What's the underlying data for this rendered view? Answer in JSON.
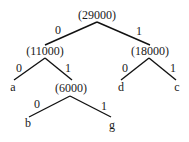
{
  "diagram": {
    "type": "huffman-tree",
    "nodes": [
      {
        "id": "root",
        "label": "(29000)",
        "x": 97,
        "y": 19
      },
      {
        "id": "n11000",
        "label": "(11000)",
        "x": 45,
        "y": 55
      },
      {
        "id": "n18000",
        "label": "(18000)",
        "x": 150,
        "y": 55
      },
      {
        "id": "leaf_a",
        "label": "a",
        "x": 13,
        "y": 91
      },
      {
        "id": "n6000",
        "label": "(6000)",
        "x": 71,
        "y": 92
      },
      {
        "id": "leaf_d",
        "label": "d",
        "x": 121,
        "y": 91
      },
      {
        "id": "leaf_c",
        "label": "c",
        "x": 177,
        "y": 91
      },
      {
        "id": "leaf_b",
        "label": "b",
        "x": 28,
        "y": 127
      },
      {
        "id": "leaf_g",
        "label": "g",
        "x": 112,
        "y": 129
      }
    ],
    "edges": [
      {
        "from": "root",
        "to": "n11000",
        "bit": "0",
        "x1": 97,
        "y1": 22,
        "x2": 45,
        "y2": 45,
        "lx": 58,
        "ly": 34
      },
      {
        "from": "root",
        "to": "n18000",
        "bit": "1",
        "x1": 97,
        "y1": 22,
        "x2": 150,
        "y2": 45,
        "lx": 139,
        "ly": 35
      },
      {
        "from": "n11000",
        "to": "leaf_a",
        "bit": "0",
        "x1": 45,
        "y1": 58,
        "x2": 14,
        "y2": 80,
        "lx": 19,
        "ly": 72
      },
      {
        "from": "n11000",
        "to": "n6000",
        "bit": "1",
        "x1": 45,
        "y1": 58,
        "x2": 72,
        "y2": 80,
        "lx": 68,
        "ly": 72
      },
      {
        "from": "n18000",
        "to": "leaf_d",
        "bit": "0",
        "x1": 149,
        "y1": 58,
        "x2": 121,
        "y2": 80,
        "lx": 125,
        "ly": 72
      },
      {
        "from": "n18000",
        "to": "leaf_c",
        "bit": "1",
        "x1": 149,
        "y1": 58,
        "x2": 176,
        "y2": 80,
        "lx": 173,
        "ly": 72
      },
      {
        "from": "n6000",
        "to": "leaf_b",
        "bit": "0",
        "x1": 70,
        "y1": 96,
        "x2": 29,
        "y2": 117,
        "lx": 37,
        "ly": 108
      },
      {
        "from": "n6000",
        "to": "leaf_g",
        "bit": "1",
        "x1": 70,
        "y1": 96,
        "x2": 111,
        "y2": 117,
        "lx": 104,
        "ly": 110
      }
    ]
  }
}
